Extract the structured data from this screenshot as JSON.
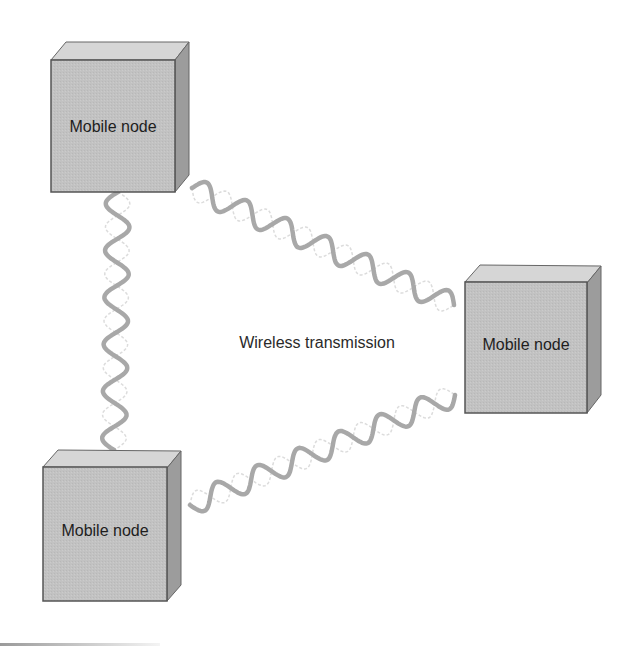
{
  "diagram": {
    "caption": "Wireless transmission",
    "nodes": [
      {
        "id": "node-top-left",
        "label": "Mobile node"
      },
      {
        "id": "node-right",
        "label": "Mobile node"
      },
      {
        "id": "node-bottom-left",
        "label": "Mobile node"
      }
    ],
    "links": [
      {
        "from": "node-top-left",
        "to": "node-right",
        "type": "wireless-wave"
      },
      {
        "from": "node-top-left",
        "to": "node-bottom-left",
        "type": "wireless-wave"
      },
      {
        "from": "node-bottom-left",
        "to": "node-right",
        "type": "wireless-wave"
      }
    ],
    "colors": {
      "front_face": "#c2c2c2",
      "top_face": "#d6d6d6",
      "side_face": "#9c9c9c",
      "edge": "#555555",
      "wave": "#a8a8a8",
      "wave_ghost": "#dcdcdc"
    }
  }
}
